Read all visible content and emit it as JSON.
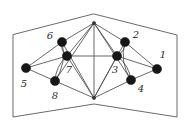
{
  "figure": {
    "background_color": "#ffffff",
    "edge_color": "#4d4d4d",
    "frame_color": "#5a5a5a",
    "node_color": "#161616",
    "label_color": "#2a2a2a",
    "width": 188,
    "height": 128
  },
  "chart_data": {
    "type": "diagram",
    "title": "",
    "nodes": [
      {
        "id": "1",
        "label": "1",
        "x": 157,
        "y": 69,
        "r": 4.6,
        "label_x": 163,
        "label_y": 55
      },
      {
        "id": "2",
        "label": "2",
        "x": 125,
        "y": 42,
        "r": 4.6,
        "label_x": 136,
        "label_y": 35
      },
      {
        "id": "3",
        "label": "3",
        "x": 117,
        "y": 56,
        "r": 4.6,
        "label_x": 115,
        "label_y": 70
      },
      {
        "id": "4",
        "label": "4",
        "x": 131,
        "y": 80,
        "r": 4.6,
        "label_x": 141,
        "label_y": 89
      },
      {
        "id": "5",
        "label": "5",
        "x": 26,
        "y": 68,
        "r": 4.6,
        "label_x": 24,
        "label_y": 84
      },
      {
        "id": "6",
        "label": "6",
        "x": 62,
        "y": 42,
        "r": 4.6,
        "label_x": 50,
        "label_y": 36
      },
      {
        "id": "7",
        "label": "7",
        "x": 67,
        "y": 56,
        "r": 4.6,
        "label_x": 69,
        "label_y": 70
      },
      {
        "id": "8",
        "label": "8",
        "x": 55,
        "y": 81,
        "r": 4.6,
        "label_x": 55,
        "label_y": 96
      },
      {
        "id": "t",
        "label": "",
        "x": 94,
        "y": 23,
        "r": 1.6,
        "label_x": 0,
        "label_y": 0
      },
      {
        "id": "b",
        "label": "",
        "x": 94,
        "y": 98,
        "r": 1.6,
        "label_x": 0,
        "label_y": 0
      }
    ],
    "edges": [
      {
        "from": "5",
        "to": "6",
        "curve": 0
      },
      {
        "from": "5",
        "to": "7",
        "curve": 0
      },
      {
        "from": "5",
        "to": "8",
        "curve": 0
      },
      {
        "from": "6",
        "to": "7",
        "curve": 5
      },
      {
        "from": "6",
        "to": "8",
        "curve": -9
      },
      {
        "from": "7",
        "to": "8",
        "curve": 6
      },
      {
        "from": "6",
        "to": "t",
        "curve": 0
      },
      {
        "from": "7",
        "to": "t",
        "curve": 0
      },
      {
        "from": "8",
        "to": "t",
        "curve": 0
      },
      {
        "from": "6",
        "to": "b",
        "curve": 0
      },
      {
        "from": "7",
        "to": "b",
        "curve": 0
      },
      {
        "from": "8",
        "to": "b",
        "curve": 0
      },
      {
        "from": "1",
        "to": "2",
        "curve": 0
      },
      {
        "from": "1",
        "to": "3",
        "curve": 0
      },
      {
        "from": "1",
        "to": "4",
        "curve": 0
      },
      {
        "from": "2",
        "to": "3",
        "curve": -5
      },
      {
        "from": "2",
        "to": "4",
        "curve": 9
      },
      {
        "from": "3",
        "to": "4",
        "curve": -6
      },
      {
        "from": "2",
        "to": "t",
        "curve": 0
      },
      {
        "from": "3",
        "to": "t",
        "curve": 0
      },
      {
        "from": "4",
        "to": "t",
        "curve": 0
      },
      {
        "from": "2",
        "to": "b",
        "curve": 0
      },
      {
        "from": "3",
        "to": "b",
        "curve": 0
      },
      {
        "from": "4",
        "to": "b",
        "curve": 0
      },
      {
        "from": "7",
        "to": "3",
        "curve": 0
      },
      {
        "from": "t",
        "to": "b",
        "curve": 0
      }
    ],
    "frame_outline": [
      {
        "x": 94,
        "y": 14
      },
      {
        "x": 177,
        "y": 35
      },
      {
        "x": 177,
        "y": 117
      },
      {
        "x": 94,
        "y": 104
      },
      {
        "x": 13,
        "y": 117
      },
      {
        "x": 13,
        "y": 35
      }
    ],
    "frame_note": "Hexagonal outer boundary: peak at top center, valley at bottom center",
    "legend": [],
    "annotations": []
  }
}
